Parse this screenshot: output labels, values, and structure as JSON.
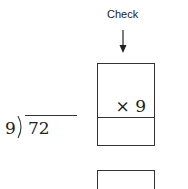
{
  "check": {
    "label": "Check",
    "arrow_icon": "arrow-down-icon"
  },
  "division": {
    "divisor": "9",
    "dividend": "72"
  },
  "check_box": {
    "multiplier": "× 9",
    "product_answer": ""
  },
  "lower_box": {
    "content": ""
  }
}
